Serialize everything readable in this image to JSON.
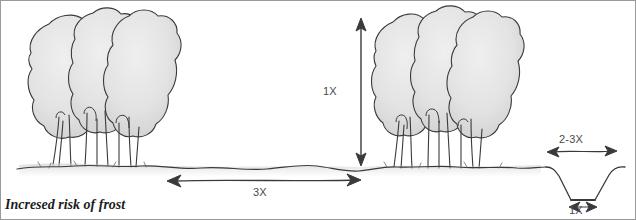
{
  "diagram": {
    "caption": "Incresed risk of frost",
    "measurements": {
      "tree_height": "1X",
      "open_gap": "3X",
      "trench_top_width": "2-3X",
      "trench_bottom_width": "1X"
    },
    "elements": {
      "left_shelterbelt_label": "left tree cluster",
      "right_shelterbelt_label": "right tree cluster",
      "ground_label": "ground line",
      "trench_label": "drainage trench"
    }
  },
  "colors": {
    "ink": "#2e2e2e",
    "canopy_fill": "#e4e4e4",
    "canopy_shade": "#d2d2d2",
    "label_text": "#4a4a4a",
    "caption_text": "#1c1c1c",
    "ground_wash": "#bdbdbd",
    "page_background": "#ffffff"
  }
}
